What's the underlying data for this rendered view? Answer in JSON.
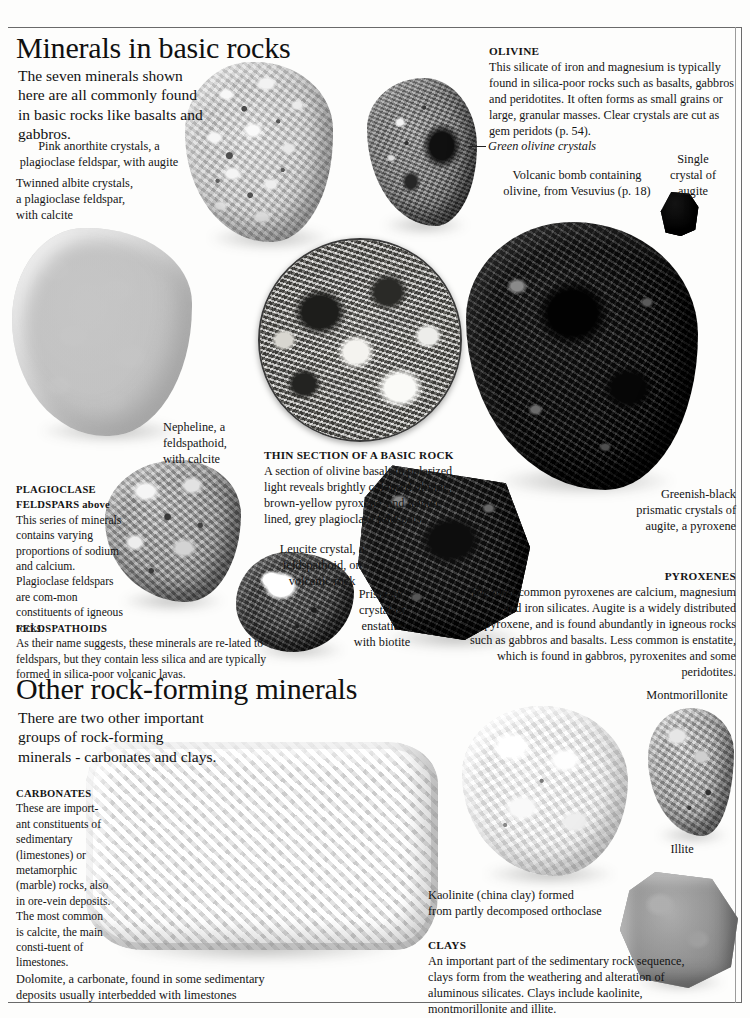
{
  "page": {
    "width": 750,
    "height": 1018,
    "background": "#fdfdfc",
    "frame_color": "#6a6a6a"
  },
  "sections": [
    {
      "id": "basic-rocks",
      "title": "Minerals in basic rocks",
      "intro": "The seven minerals shown here are all commonly found in basic rocks like basalts and gabbros."
    },
    {
      "id": "other-rock-forming",
      "title": "Other rock-forming minerals",
      "intro": "There are two other important groups of rock-forming minerals - carbonates and clays."
    }
  ],
  "captions": {
    "anorthite": "Pink anorthite crystals, a\nplagioclase feldspar, with augite",
    "albite": "Twinned albite crystals,\na plagioclase feldspar,\nwith calcite",
    "green_olivine": "Green olivine crystals",
    "volcanic_bomb": "Volcanic bomb containing\nolivine, from Vesuvius (p. 18)",
    "single_augite": "Single\ncrystal of\naugite",
    "nepheline": "Nepheline, a\nfeldspathoid,\nwith calcite",
    "leucite": "Leucite crystal, a\nfeldspathoid, on\nvolcanic rock",
    "enstatite": "Prismatic\ncrystal of\nenstatite\nwith biotite",
    "augite_prismatic": "Greenish-black\nprismatic crystals of\naugite, a pyroxene",
    "dolomite": "Dolomite, a carbonate, found in some sedimentary\ndeposits usually interbedded with limestones",
    "kaolinite": "Kaolinite (china clay) formed\nfrom partly decomposed orthoclase",
    "montmorillonite": "Montmorillonite",
    "illite": "Illite"
  },
  "text_blocks": {
    "olivine": {
      "heading": "OLIVINE",
      "body": "This silicate of iron and magnesium is typically found in silica-poor rocks such as basalts, gabbros and peridotites.  It often forms as small grains or large, granular masses. Clear crystals are cut as gem peridots (p. 54)."
    },
    "thin_section": {
      "heading": "THIN SECTION OF A  BASIC ROCK",
      "body": "A section of olivine basalt in polarized light reveals brightly coloured olivine, brown-yellow pyroxene, and minute lined, grey plagioclase feldspars."
    },
    "plagioclase": {
      "heading": "PLAGIOCLASE",
      "heading2": "FELDSPARS",
      "heading_italic": "above",
      "body": "This series of minerals contains varying proportions of sodium and calcium.  Plagioclase feldspars are com-mon constituents of igneous rocks."
    },
    "feldspathoids": {
      "heading": "FELDSPATHOIDS",
      "body": "As their name suggests, these minerals are re-lated to feldspars, but they contain less silica and are typically formed in silica-poor volcanic lavas."
    },
    "pyroxenes": {
      "heading": "PYROXENES",
      "body": "The most common pyroxenes are calcium, magnesium and iron silicates. Augite is a widely distributed pyroxene, and is found abundantly in igneous rocks such as gabbros and basalts. Less common is enstatite, which is found in gabbros, pyroxenites and some peridotites."
    },
    "carbonates": {
      "heading": "CARBONATES",
      "body": "These are import-ant constituents of sedimentary (limestones) or metamorphic (marble) rocks, also in ore-vein deposits. The most common is calcite, the main consti-tuent of limestones."
    },
    "clays": {
      "heading": "CLAYS",
      "body": "An important part of the sedimentary rock sequence, clays form from the weathering and alteration of aluminous silicates. Clays include kaolinite, montmorillonite and illite."
    }
  },
  "specimens": [
    {
      "name": "anorthite-rock",
      "label": "Pink anorthite with augite"
    },
    {
      "name": "volcanic-bomb-rock",
      "label": "Volcanic bomb with olivine"
    },
    {
      "name": "albite-rock",
      "label": "Twinned albite crystals"
    },
    {
      "name": "thin-section-circle",
      "label": "Thin section of basic rock"
    },
    {
      "name": "augite-mass-rock",
      "label": "Greenish-black augite mass"
    },
    {
      "name": "single-augite-crystal",
      "label": "Single crystal of augite"
    },
    {
      "name": "nepheline-rock",
      "label": "Nepheline with calcite"
    },
    {
      "name": "leucite-rock",
      "label": "Leucite crystal on volcanic rock"
    },
    {
      "name": "enstatite-rock",
      "label": "Prismatic enstatite with biotite"
    },
    {
      "name": "dolomite-rock",
      "label": "Dolomite carbonate specimen"
    },
    {
      "name": "kaolinite-rock",
      "label": "Kaolinite china clay"
    },
    {
      "name": "montmorillonite-rock",
      "label": "Montmorillonite specimen"
    },
    {
      "name": "illite-rock",
      "label": "Illite specimen"
    }
  ]
}
